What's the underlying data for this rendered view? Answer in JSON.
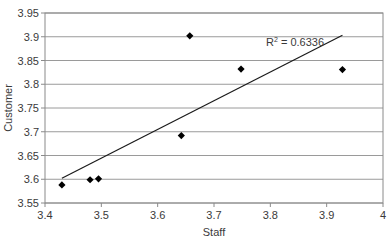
{
  "chart_data": {
    "type": "scatter",
    "title": "",
    "xlabel": "Staff",
    "ylabel": "Customer",
    "xlim": [
      3.4,
      4.0
    ],
    "ylim": [
      3.55,
      3.95
    ],
    "xticks": [
      "3.4",
      "3.5",
      "3.6",
      "3.7",
      "3.8",
      "3.9",
      "4"
    ],
    "yticks": [
      "3.55",
      "3.6",
      "3.65",
      "3.7",
      "3.75",
      "3.8",
      "3.85",
      "3.9",
      "3.95"
    ],
    "grid": "horizontal",
    "legend": "none",
    "series": [
      {
        "name": "Customer vs Staff",
        "marker": "diamond",
        "points": [
          {
            "x": 3.43,
            "y": 3.588
          },
          {
            "x": 3.48,
            "y": 3.599
          },
          {
            "x": 3.495,
            "y": 3.601
          },
          {
            "x": 3.642,
            "y": 3.692
          },
          {
            "x": 3.657,
            "y": 3.902
          },
          {
            "x": 3.748,
            "y": 3.832
          },
          {
            "x": 3.928,
            "y": 3.831
          }
        ]
      }
    ],
    "trendline": {
      "type": "linear",
      "from": {
        "x": 3.43,
        "y": 3.602
      },
      "to": {
        "x": 3.928,
        "y": 3.903
      },
      "annotation": "R² = 0.6336"
    }
  },
  "annotation": {
    "r_squared_label": "R",
    "r_squared_sup": "2",
    "r_squared_value": " = 0.6336"
  },
  "axes": {
    "x_label": "Staff",
    "y_label": "Customer"
  }
}
